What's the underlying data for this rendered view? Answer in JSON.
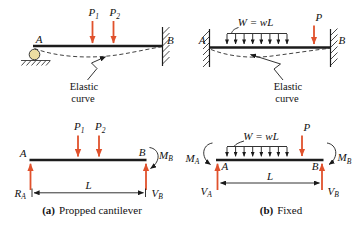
{
  "colors": {
    "load_and_reaction_arrows": "#e0512c",
    "beam_ink": "#1c1c1c",
    "roller_fill": "#ecdda2",
    "background": "#ffffff"
  },
  "captions": {
    "a_prefix": "(a)",
    "a_text": "Propped cantilever",
    "b_prefix": "(b)",
    "b_text": "Fixed"
  },
  "diagrams": {
    "propped_elevation": {
      "end_a": "A",
      "end_b": "B",
      "load1": {
        "base": "P",
        "sub": "1"
      },
      "load2": {
        "base": "P",
        "sub": "2"
      },
      "annotation": [
        "Elastic",
        "curve"
      ]
    },
    "fixed_elevation": {
      "end_a": "A",
      "end_b": "B",
      "dist_load": "W = wL",
      "point_load": "P",
      "annotation": [
        "Elastic",
        "curve"
      ]
    },
    "propped_fbd": {
      "end_a": "A",
      "end_b": "B",
      "load1": {
        "base": "P",
        "sub": "1"
      },
      "load2": {
        "base": "P",
        "sub": "2"
      },
      "reaction_left": {
        "base": "R",
        "sub": "A"
      },
      "reaction_right": {
        "base": "V",
        "sub": "B"
      },
      "moment_right": {
        "base": "M",
        "sub": "B"
      },
      "span": "L"
    },
    "fixed_fbd": {
      "end_a": "A",
      "end_b": "B",
      "dist_load": "W = wL",
      "point_load": "P",
      "moment_left": {
        "base": "M",
        "sub": "A"
      },
      "moment_right": {
        "base": "M",
        "sub": "B"
      },
      "reaction_left": {
        "base": "V",
        "sub": "A"
      },
      "reaction_right": {
        "base": "V",
        "sub": "B"
      },
      "span": "L"
    }
  }
}
